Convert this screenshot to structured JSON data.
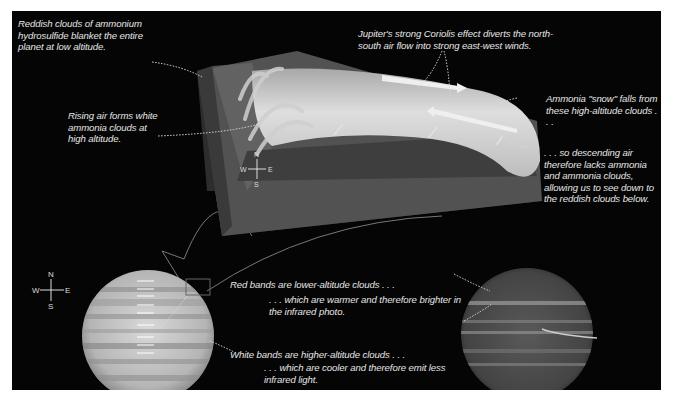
{
  "figure": {
    "colors": {
      "background": "#050505",
      "border": "#ffffff",
      "text": "#e6e6e6",
      "block_side": "#5a5a5a",
      "cloud_white": "#d8d8d8"
    }
  },
  "annotations": {
    "reddish_clouds": "Reddish clouds of ammonium hydrosulfide blanket the entire planet at low altitude.",
    "rising_air": "Rising air forms white ammonia clouds at high altitude.",
    "coriolis": "Jupiter's strong Coriolis effect diverts the north-south air flow into strong east-west winds.",
    "ammonia_snow": "Ammonia \"snow\" falls from these high-altitude clouds . . .",
    "descending_air": ". . . so descending air therefore lacks ammonia and ammonia clouds, allowing us to see down to the reddish clouds below.",
    "red_bands": "Red bands are lower-altitude clouds . . .",
    "warmer": ". . . which are warmer and therefore brighter in the infrared photo.",
    "white_bands": "White bands are higher-altitude clouds . . .",
    "cooler": ". . . which are cooler and therefore emit less infrared light."
  },
  "compass": {
    "n": "N",
    "s": "S",
    "e": "E",
    "w": "W"
  },
  "panels": {
    "visible_planet": "Jupiter visible-light image with wind arrows",
    "infrared_planet": "Jupiter infrared image",
    "block": "3D cutaway of atmospheric block"
  }
}
